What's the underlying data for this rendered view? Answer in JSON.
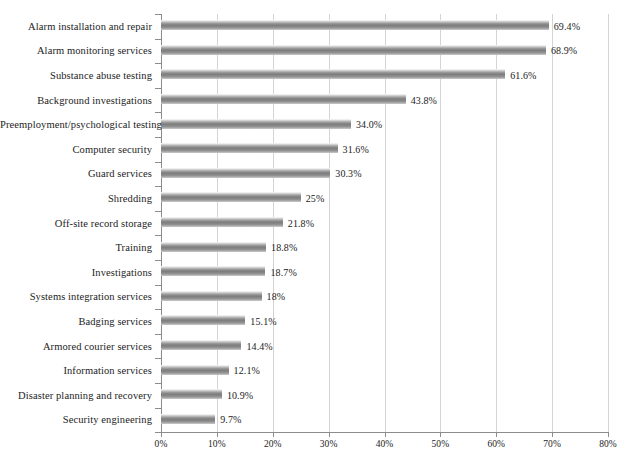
{
  "chart_data": {
    "type": "bar",
    "orientation": "horizontal",
    "title": "",
    "subtitle": "",
    "xlabel": "",
    "ylabel": "",
    "xlim": [
      0,
      80
    ],
    "xticks": [
      "0%",
      "10%",
      "20%",
      "30%",
      "40%",
      "50%",
      "60%",
      "70%",
      "80%"
    ],
    "xtick_values": [
      0,
      10,
      20,
      30,
      40,
      50,
      60,
      70,
      80
    ],
    "grid": true,
    "grid_axis": "x",
    "legend": false,
    "legend_position": "none",
    "bar_color": "#7c7c7c",
    "categories": [
      "Alarm installation and repair",
      "Alarm monitoring services",
      "Substance abuse testing",
      "Background investigations",
      "Preemployment/psychological testing",
      "Computer security",
      "Guard services",
      "Shredding",
      "Off-site record storage",
      "Training",
      "Investigations",
      "Systems integration services",
      "Badging services",
      "Armored courier services",
      "Information services",
      "Disaster planning and recovery",
      "Security engineering"
    ],
    "values": [
      69.4,
      68.9,
      61.6,
      43.8,
      34.0,
      31.6,
      30.3,
      25,
      21.8,
      18.8,
      18.7,
      18,
      15.1,
      14.4,
      12.1,
      10.9,
      9.7
    ],
    "data_labels": [
      "69.4%",
      "68.9%",
      "61.6%",
      "43.8%",
      "34.0%",
      "31.6%",
      "30.3%",
      "25%",
      "21.8%",
      "18.8%",
      "18.7%",
      "18%",
      "15.1%",
      "14.4%",
      "12.1%",
      "10.9%",
      "9.7%"
    ]
  },
  "caption": {
    "text": ""
  }
}
